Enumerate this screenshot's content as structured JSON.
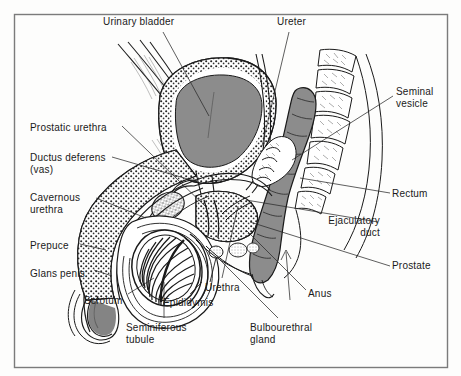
{
  "figure": {
    "frame": {
      "x": 14,
      "y": 14,
      "width": 434,
      "height": 354,
      "border_color": "#7b7b7b"
    },
    "background_color": "#fdfdfc",
    "ink_color": "#1a1a1a",
    "organ_fill_gray": "#8c8c8c",
    "label_font_size_px": 10
  },
  "labels": [
    {
      "name": "urinary-bladder",
      "text": "Urinary bladder",
      "x": 103,
      "y": 16,
      "align": "left"
    },
    {
      "name": "ureter",
      "text": "Ureter",
      "x": 277,
      "y": 16,
      "align": "left"
    },
    {
      "name": "seminal-vesicle",
      "text": "Seminal\nvesicle",
      "x": 396,
      "y": 86,
      "align": "left"
    },
    {
      "name": "prostatic-urethra",
      "text": "Prostatic urethra",
      "x": 30,
      "y": 122,
      "align": "left"
    },
    {
      "name": "ductus-deferens",
      "text": "Ductus deferens\n(vas)",
      "x": 30,
      "y": 152,
      "align": "left"
    },
    {
      "name": "rectum",
      "text": "Rectum",
      "x": 392,
      "y": 188,
      "align": "left"
    },
    {
      "name": "cavernous-urethra",
      "text": "Cavernous\nurethra",
      "x": 30,
      "y": 192,
      "align": "left"
    },
    {
      "name": "ejaculatory-duct",
      "text": "Ejaculatory\nduct",
      "x": 380,
      "y": 215,
      "align": "right"
    },
    {
      "name": "prepuce",
      "text": "Prepuce",
      "x": 30,
      "y": 240,
      "align": "left"
    },
    {
      "name": "prostate",
      "text": "Prostate",
      "x": 392,
      "y": 260,
      "align": "left"
    },
    {
      "name": "urethra",
      "text": "Urethra",
      "x": 205,
      "y": 282,
      "align": "left"
    },
    {
      "name": "glans-penis",
      "text": "Glans penis",
      "x": 30,
      "y": 268,
      "align": "left"
    },
    {
      "name": "anus",
      "text": "Anus",
      "x": 308,
      "y": 288,
      "align": "left"
    },
    {
      "name": "scrotum",
      "text": "Scrotum",
      "x": 84,
      "y": 295,
      "align": "left"
    },
    {
      "name": "epididymis",
      "text": "Epididymis",
      "x": 163,
      "y": 297,
      "align": "left"
    },
    {
      "name": "seminiferous-tubule",
      "text": "Seminiferous\ntubule",
      "x": 126,
      "y": 322,
      "align": "left"
    },
    {
      "name": "bulbourethral-gland",
      "text": "Bulbourethral\ngland",
      "x": 250,
      "y": 322,
      "align": "left"
    }
  ],
  "structures": [
    {
      "name": "urinary-bladder",
      "fill": "gray",
      "description": "large gray-filled bladder, upper center"
    },
    {
      "name": "rectum",
      "fill": "gray",
      "description": "gray-filled rectum running down right of center"
    },
    {
      "name": "sacrum-vertebrae",
      "fill": "none",
      "description": "stacked vertebral bodies upper right"
    },
    {
      "name": "testis",
      "fill": "none",
      "description": "oval testis with radiating seminiferous lobules"
    },
    {
      "name": "epididymis",
      "fill": "none",
      "description": "crescent along posterior testis"
    },
    {
      "name": "penis-shaft",
      "fill": "stipple",
      "description": "stippled corpus cavernosum shaft"
    },
    {
      "name": "prostate-gland",
      "fill": "stipple",
      "description": "stippled prostate below bladder"
    },
    {
      "name": "seminal-vesicle",
      "fill": "none",
      "description": "lobulated sac behind bladder"
    },
    {
      "name": "scrotum",
      "fill": "none",
      "description": "scrotal sac enclosing testis"
    },
    {
      "name": "pubic-bone",
      "fill": "stipple",
      "description": "stippled pubic symphysis"
    }
  ]
}
